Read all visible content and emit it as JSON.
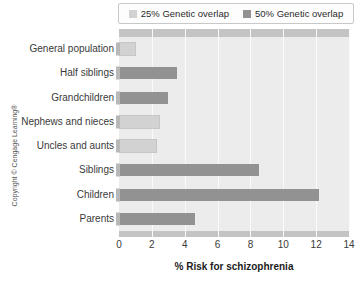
{
  "chart_data": {
    "type": "bar",
    "orientation": "horizontal",
    "title": "",
    "xlabel": "% Risk for schizophrenia",
    "ylabel": "",
    "xlim": [
      0,
      14
    ],
    "xticks": [
      0,
      2,
      4,
      6,
      8,
      10,
      12,
      14
    ],
    "grid": true,
    "legend_position": "top",
    "categories": [
      "General population",
      "Half siblings",
      "Grandchildren",
      "Nephews and nieces",
      "Uncles and aunts",
      "Siblings",
      "Children",
      "Parents"
    ],
    "values": [
      0.9,
      3.5,
      3.0,
      2.4,
      2.2,
      8.5,
      12.2,
      4.6
    ],
    "bar_groups": [
      "25% Genetic overlap",
      "50% Genetic overlap",
      "50% Genetic overlap",
      "25% Genetic overlap",
      "25% Genetic overlap",
      "50% Genetic overlap",
      "50% Genetic overlap",
      "50% Genetic overlap"
    ],
    "legend": [
      {
        "label": "25% Genetic overlap",
        "color": "#d2d2d2"
      },
      {
        "label": "50% Genetic overlap",
        "color": "#929292"
      }
    ]
  },
  "colors": {
    "plot_background": "#ececec",
    "gridline": "#fafafa",
    "band": "#c4c4c4",
    "bar_light": "#d2d2d2",
    "bar_dark": "#929292",
    "text": "#3a3a3a"
  },
  "footer": {
    "copyright": "Copyright © Cengage Learning®"
  }
}
